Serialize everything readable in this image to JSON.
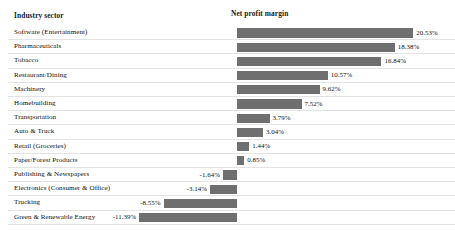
{
  "headers": {
    "industry": "Industry sector",
    "margin": "Net profit margin"
  },
  "colors": {
    "bar": "#6f6f6f",
    "gridline": "#e3e3e3",
    "text": "#111111",
    "background": "#ffffff"
  },
  "chart_data": {
    "type": "bar",
    "orientation": "horizontal",
    "title": "",
    "xlabel": "Net profit margin",
    "ylabel": "Industry sector",
    "grid": true,
    "legend": null,
    "xlim": [
      -11.39,
      20.53
    ],
    "zero_baseline": true,
    "value_format": "percent",
    "categories": [
      "Software (Entertainment)",
      "Pharmaceuticals",
      "Tobacco",
      "Restaurant/Dining",
      "Machinery",
      "Homebuilding",
      "Transportation",
      "Auto & Truck",
      "Retail (Groceries)",
      "Paper/Forest Products",
      "Publishing & Newspapers",
      "Electronics (Consumer & Office)",
      "Trucking",
      "Green & Renewable Energy"
    ],
    "values": [
      20.53,
      18.38,
      16.84,
      10.57,
      9.62,
      7.52,
      3.79,
      3.04,
      1.44,
      0.85,
      -1.64,
      -3.14,
      -8.55,
      -11.39
    ],
    "labels": [
      "20.53%",
      "18.38%",
      "16.84%",
      "10.57%",
      "9.62%",
      "7.52%",
      "3.79%",
      "3.04%",
      "1.44%",
      "0.85%",
      "-1.64%",
      "-3.14%",
      "-8.55%",
      "-11.39%"
    ]
  },
  "rows": [
    {
      "label": "Software (Entertainment)",
      "value": 20.53,
      "value_label": "20.53%"
    },
    {
      "label": "Pharmaceuticals",
      "value": 18.38,
      "value_label": "18.38%"
    },
    {
      "label": "Tobacco",
      "value": 16.84,
      "value_label": "16.84%"
    },
    {
      "label": "Restaurant/Dining",
      "value": 10.57,
      "value_label": "10.57%"
    },
    {
      "label": "Machinery",
      "value": 9.62,
      "value_label": "9.62%"
    },
    {
      "label": "Homebuilding",
      "value": 7.52,
      "value_label": "7.52%"
    },
    {
      "label": "Transportation",
      "value": 3.79,
      "value_label": "3.79%"
    },
    {
      "label": "Auto & Truck",
      "value": 3.04,
      "value_label": "3.04%"
    },
    {
      "label": "Retail (Groceries)",
      "value": 1.44,
      "value_label": "1.44%"
    },
    {
      "label": "Paper/Forest Products",
      "value": 0.85,
      "value_label": "0.85%"
    },
    {
      "label": "Publishing & Newspapers",
      "value": -1.64,
      "value_label": "-1.64%"
    },
    {
      "label": "Electronics (Consumer & Office)",
      "value": -3.14,
      "value_label": "-3.14%"
    },
    {
      "label": "Trucking",
      "value": -8.55,
      "value_label": "-8.55%"
    },
    {
      "label": "Green & Renewable Energy",
      "value": -11.39,
      "value_label": "-11.39%"
    }
  ]
}
